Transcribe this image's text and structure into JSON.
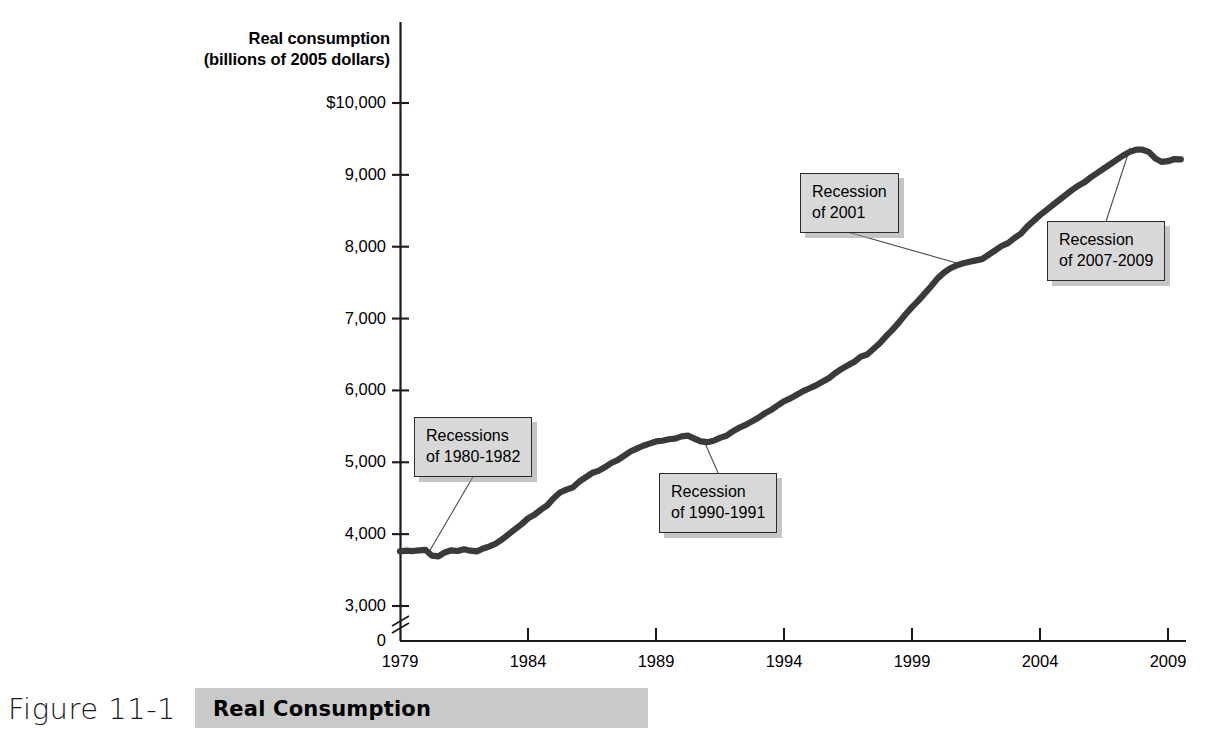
{
  "figure": {
    "number": "Figure 11-1",
    "title": "Real Consumption"
  },
  "chart_data": {
    "type": "line",
    "title": "Real Consumption",
    "xlabel": "",
    "ylabel": "Real consumption (billions of 2005 dollars)",
    "ylabel_line1": "Real consumption",
    "ylabel_line2": "(billions of 2005 dollars)",
    "grid": false,
    "legend": false,
    "axis_break_y": true,
    "xlim": [
      1979,
      2009.8
    ],
    "ylim": [
      3000,
      10000
    ],
    "ytick_labels": [
      "$10,000",
      "9,000",
      "8,000",
      "7,000",
      "6,000",
      "5,000",
      "4,000",
      "3,000",
      "0"
    ],
    "yticks": [
      10000,
      9000,
      8000,
      7000,
      6000,
      5000,
      4000,
      3000,
      0
    ],
    "xtick_labels": [
      "1979",
      "1984",
      "1989",
      "1994",
      "1999",
      "2004",
      "2009"
    ],
    "xticks": [
      1979,
      1984,
      1989,
      1994,
      1999,
      2004,
      2009
    ],
    "series": [
      {
        "name": "Real consumption",
        "color": "#3a3a3a",
        "x": [
          1979.0,
          1979.25,
          1979.5,
          1979.75,
          1980.0,
          1980.25,
          1980.5,
          1980.75,
          1981.0,
          1981.25,
          1981.5,
          1981.75,
          1982.0,
          1982.25,
          1982.5,
          1982.75,
          1983.0,
          1983.25,
          1983.5,
          1983.75,
          1984.0,
          1984.25,
          1984.5,
          1984.75,
          1985.0,
          1985.25,
          1985.5,
          1985.75,
          1986.0,
          1986.25,
          1986.5,
          1986.75,
          1987.0,
          1987.25,
          1987.5,
          1987.75,
          1988.0,
          1988.25,
          1988.5,
          1988.75,
          1989.0,
          1989.25,
          1989.5,
          1989.75,
          1990.0,
          1990.25,
          1990.5,
          1990.75,
          1991.0,
          1991.25,
          1991.5,
          1991.75,
          1992.0,
          1992.25,
          1992.5,
          1992.75,
          1993.0,
          1993.25,
          1993.5,
          1993.75,
          1994.0,
          1994.25,
          1994.5,
          1994.75,
          1995.0,
          1995.25,
          1995.5,
          1995.75,
          1996.0,
          1996.25,
          1996.5,
          1996.75,
          1997.0,
          1997.25,
          1997.5,
          1997.75,
          1998.0,
          1998.25,
          1998.5,
          1998.75,
          1999.0,
          1999.25,
          1999.5,
          1999.75,
          2000.0,
          2000.25,
          2000.5,
          2000.75,
          2001.0,
          2001.25,
          2001.5,
          2001.75,
          2002.0,
          2002.25,
          2002.5,
          2002.75,
          2003.0,
          2003.25,
          2003.5,
          2003.75,
          2004.0,
          2004.25,
          2004.5,
          2004.75,
          2005.0,
          2005.25,
          2005.5,
          2005.75,
          2006.0,
          2006.25,
          2006.5,
          2006.75,
          2007.0,
          2007.25,
          2007.5,
          2007.75,
          2008.0,
          2008.25,
          2008.5,
          2008.75,
          2009.0,
          2009.25,
          2009.5
        ],
        "y": [
          3760,
          3770,
          3765,
          3775,
          3780,
          3700,
          3690,
          3745,
          3775,
          3765,
          3790,
          3770,
          3760,
          3800,
          3830,
          3870,
          3930,
          4000,
          4070,
          4140,
          4220,
          4270,
          4340,
          4400,
          4500,
          4580,
          4620,
          4650,
          4730,
          4790,
          4850,
          4880,
          4930,
          4990,
          5030,
          5090,
          5150,
          5190,
          5230,
          5260,
          5290,
          5300,
          5320,
          5330,
          5360,
          5370,
          5330,
          5290,
          5280,
          5300,
          5340,
          5370,
          5430,
          5480,
          5520,
          5570,
          5620,
          5680,
          5730,
          5790,
          5850,
          5890,
          5940,
          5990,
          6030,
          6070,
          6120,
          6170,
          6240,
          6300,
          6350,
          6400,
          6470,
          6500,
          6580,
          6660,
          6760,
          6850,
          6950,
          7060,
          7160,
          7250,
          7350,
          7450,
          7560,
          7640,
          7700,
          7740,
          7770,
          7790,
          7810,
          7830,
          7890,
          7950,
          8010,
          8050,
          8120,
          8180,
          8280,
          8360,
          8440,
          8510,
          8580,
          8650,
          8720,
          8790,
          8850,
          8900,
          8970,
          9030,
          9090,
          9150,
          9210,
          9270,
          9320,
          9350,
          9350,
          9320,
          9230,
          9180,
          9190,
          9220,
          9215
        ]
      }
    ],
    "annotations": [
      {
        "id": "recessions-1980-1982",
        "line1": "Recessions",
        "line2": "of 1980-1982",
        "box_left": 414,
        "box_top": 417,
        "point_x": 400,
        "point_y": 440,
        "target_x": 429,
        "target_y": 552
      },
      {
        "id": "recession-1990-1991",
        "line1": "Recession",
        "line2": "of 1990-1991",
        "box_left": 659,
        "box_top": 473,
        "point_x": 400,
        "point_y": 440,
        "target_x": 704,
        "target_y": 441
      },
      {
        "id": "recession-2001",
        "line1": "Recession",
        "line2": "of 2001",
        "box_left": 800,
        "box_top": 173,
        "point_x": 400,
        "point_y": 440,
        "target_x": 960,
        "target_y": 264
      },
      {
        "id": "recession-2007-2009",
        "line1": "Recession",
        "line2": "of 2007-2009",
        "box_left": 1047,
        "box_top": 221,
        "point_x": 400,
        "point_y": 440,
        "target_x": 1130,
        "target_y": 148
      }
    ]
  }
}
